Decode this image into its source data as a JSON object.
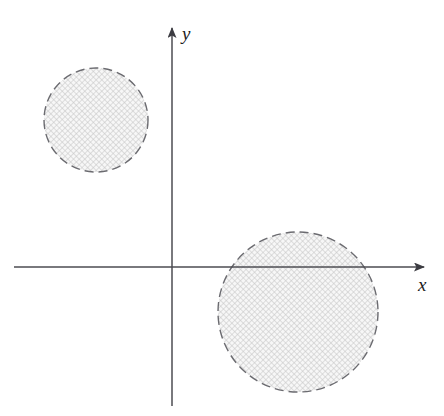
{
  "figure": {
    "width": 444,
    "height": 416,
    "background_color": "#ffffff"
  },
  "chart_data": {
    "type": "scatter",
    "title": "",
    "subtitle": "",
    "xlabel": "x",
    "ylabel": "y",
    "grid": false,
    "legend": null,
    "axes": {
      "origin_px": [
        172,
        267
      ],
      "x_axis": {
        "label": "x",
        "label_position_px": [
          418,
          276
        ],
        "start_px": [
          14,
          267
        ],
        "end_px": [
          430,
          267
        ],
        "arrow": "end",
        "ticks": [],
        "tick_labels": []
      },
      "y_axis": {
        "label": "y",
        "label_position_px": [
          182,
          25
        ],
        "start_px": [
          172,
          406
        ],
        "end_px": [
          172,
          22
        ],
        "arrow": "end",
        "ticks": [],
        "tick_labels": []
      },
      "color": "#4d4d52",
      "line_width": 1.5
    },
    "shapes": [
      {
        "name": "upper-left-disk",
        "type": "circle",
        "quadrant": "II",
        "center_px": [
          96,
          120
        ],
        "radius_px": 52,
        "border_style": "dashed",
        "border_color": "#6b6b70",
        "border_width": 1.4,
        "dash_pattern": "9 5",
        "fill": "crosshatch",
        "fill_color": "#f3f3f3",
        "hatch_color": "#c9c9c9",
        "hatch_spacing_px": 4
      },
      {
        "name": "lower-right-disk",
        "type": "circle",
        "quadrant": "IV",
        "center_px": [
          298,
          312
        ],
        "radius_px": 80,
        "border_style": "dashed",
        "border_color": "#6b6b70",
        "border_width": 1.4,
        "dash_pattern": "9 5",
        "fill": "crosshatch",
        "fill_color": "#f3f3f3",
        "hatch_color": "#c9c9c9",
        "hatch_spacing_px": 4
      }
    ],
    "annotations": []
  }
}
